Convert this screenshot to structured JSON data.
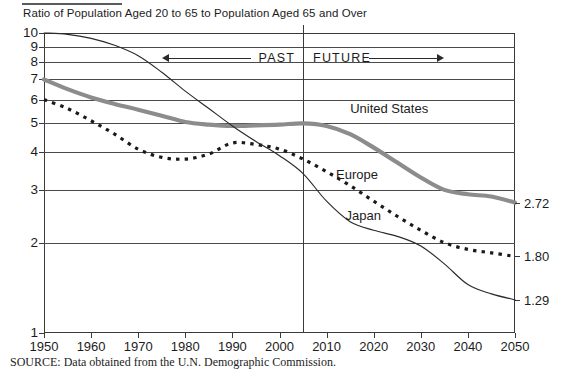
{
  "chart_data": {
    "type": "line",
    "title": "Ratio of Population Aged 20 to 65 to Population Aged 65 and Over",
    "xlabel": "",
    "ylabel": "",
    "yscale": "log",
    "ylim": [
      1,
      10
    ],
    "xlim": [
      1950,
      2050
    ],
    "grid": true,
    "legend": "inline-annotations",
    "ytick_labels": [
      "10",
      "9",
      "8",
      "7",
      "6",
      "5",
      "4",
      "3",
      "2",
      "1"
    ],
    "ytick_values": [
      10,
      9,
      8,
      7,
      6,
      5,
      4,
      3,
      2,
      1
    ],
    "xtick_labels": [
      "1950",
      "1960",
      "1970",
      "1980",
      "1990",
      "2000",
      "2010",
      "2020",
      "2030",
      "2040",
      "2050"
    ],
    "xtick_values": [
      1950,
      1960,
      1970,
      1980,
      1990,
      2000,
      2010,
      2020,
      2030,
      2040,
      2050
    ],
    "divider_year": 2005,
    "annotations": [
      {
        "text": "PAST",
        "kind": "era-arrow",
        "direction": "left",
        "year_from": 2005,
        "year_to": 1975
      },
      {
        "text": "FUTURE",
        "kind": "era-arrow",
        "direction": "right",
        "year_from": 2005,
        "year_to": 2035
      }
    ],
    "series": [
      {
        "name": "United States",
        "style": "thick-solid-gray",
        "color": "#8c8c8c",
        "label_year": 2015,
        "label_value": 5.9,
        "end_label": "2.72",
        "x": [
          1950,
          1955,
          1960,
          1965,
          1970,
          1975,
          1980,
          1985,
          1990,
          1995,
          2000,
          2005,
          2010,
          2015,
          2020,
          2025,
          2030,
          2035,
          2040,
          2045,
          2050
        ],
        "values": [
          7.0,
          6.5,
          6.1,
          5.8,
          5.55,
          5.3,
          5.05,
          4.95,
          4.9,
          4.92,
          4.95,
          5.0,
          4.9,
          4.6,
          4.15,
          3.7,
          3.3,
          3.0,
          2.9,
          2.85,
          2.72
        ]
      },
      {
        "name": "Europe",
        "style": "dotted",
        "color": "#1a1a1a",
        "label_year": 2012,
        "label_value": 3.55,
        "end_label": "1.80",
        "x": [
          1950,
          1955,
          1960,
          1965,
          1970,
          1975,
          1980,
          1985,
          1990,
          1995,
          2000,
          2005,
          2010,
          2015,
          2020,
          2025,
          2030,
          2035,
          2040,
          2045,
          2050
        ],
        "values": [
          6.0,
          5.6,
          5.1,
          4.6,
          4.1,
          3.85,
          3.8,
          3.95,
          4.3,
          4.25,
          4.1,
          3.8,
          3.45,
          3.1,
          2.75,
          2.45,
          2.2,
          2.0,
          1.9,
          1.85,
          1.8
        ]
      },
      {
        "name": "Japan",
        "style": "thin-solid",
        "color": "#2a2a2a",
        "label_year": 2014,
        "label_value": 2.6,
        "end_label": "1.29",
        "x": [
          1950,
          1955,
          1960,
          1965,
          1970,
          1975,
          1980,
          1985,
          1990,
          1995,
          2000,
          2005,
          2010,
          2015,
          2020,
          2025,
          2030,
          2035,
          2040,
          2045,
          2050
        ],
        "values": [
          10.0,
          9.9,
          9.6,
          9.1,
          8.4,
          7.4,
          6.4,
          5.6,
          4.9,
          4.35,
          3.9,
          3.4,
          2.75,
          2.35,
          2.2,
          2.1,
          1.95,
          1.7,
          1.45,
          1.35,
          1.29
        ]
      }
    ]
  },
  "figure": {
    "source_note": "SOURCE: Data obtained from the U.N. Demographic Commission."
  }
}
